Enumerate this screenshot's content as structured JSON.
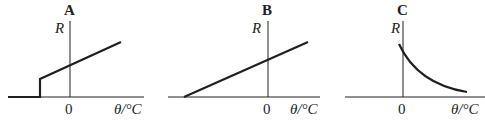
{
  "graphs": [
    {
      "label": "A",
      "y_axis_label": "R",
      "x_axis_label": "θ/°C",
      "origin_tick": "0",
      "description": "Resistance zero below a negative temperature, then jumps and increases linearly"
    },
    {
      "label": "B",
      "y_axis_label": "R",
      "x_axis_label": "θ/°C",
      "origin_tick": "0",
      "description": "Resistance increases linearly with temperature from zero at a negative temperature"
    },
    {
      "label": "C",
      "y_axis_label": "R",
      "x_axis_label": "θ/°C",
      "origin_tick": "0",
      "description": "Resistance decreases non-linearly (decaying curve) with temperature above 0"
    }
  ],
  "colors": {
    "ink": "#231f20",
    "background": "#ffffff"
  }
}
